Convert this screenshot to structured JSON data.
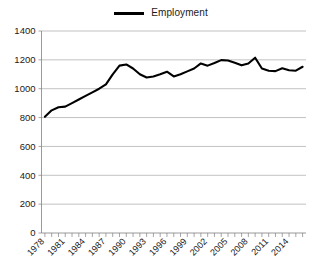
{
  "chart_data": {
    "type": "line",
    "title": "",
    "xlabel": "",
    "ylabel": "",
    "ylim": [
      0,
      1400
    ],
    "ytick_values": [
      0,
      200,
      400,
      600,
      800,
      1000,
      1200,
      1400
    ],
    "ytick_labels": [
      "0",
      "200",
      "400",
      "600",
      "800",
      "1000",
      "1200",
      "1400"
    ],
    "grid": true,
    "legend_position": "top-center",
    "legend": [
      "Employment"
    ],
    "xtick_label_rotation": 45,
    "xtick_label_interval": 3,
    "x": [
      1978,
      1979,
      1980,
      1981,
      1982,
      1983,
      1984,
      1985,
      1986,
      1987,
      1988,
      1989,
      1990,
      1991,
      1992,
      1993,
      1994,
      1995,
      1996,
      1997,
      1998,
      1999,
      2000,
      2001,
      2002,
      2003,
      2004,
      2005,
      2006,
      2007,
      2008,
      2009,
      2010,
      2011,
      2012,
      2013,
      2014,
      2015,
      2016
    ],
    "xtick_labels": [
      "1978",
      "",
      "",
      "1981",
      "",
      "",
      "1984",
      "",
      "",
      "1987",
      "",
      "",
      "1990",
      "",
      "",
      "1993",
      "",
      "",
      "1996",
      "",
      "",
      "1999",
      "",
      "",
      "2002",
      "",
      "",
      "2005",
      "",
      "",
      "2008",
      "",
      "",
      "2011",
      "",
      "",
      "2014",
      "",
      ""
    ],
    "series": [
      {
        "name": "Employment",
        "color": "#000000",
        "values": [
          805,
          850,
          872,
          876,
          900,
          925,
          950,
          975,
          1000,
          1030,
          1100,
          1160,
          1168,
          1140,
          1100,
          1078,
          1085,
          1100,
          1118,
          1085,
          1100,
          1120,
          1140,
          1175,
          1160,
          1178,
          1198,
          1196,
          1180,
          1162,
          1175,
          1215,
          1140,
          1125,
          1122,
          1142,
          1128,
          1125,
          1152
        ]
      }
    ]
  }
}
